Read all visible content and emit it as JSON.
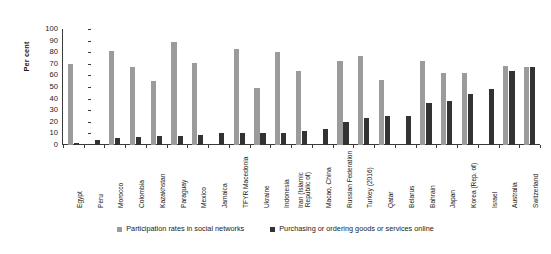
{
  "chart_data": {
    "type": "bar",
    "title": "",
    "xlabel": "",
    "ylabel": "Per cent",
    "ylim": [
      0,
      100
    ],
    "yticks": [
      0,
      10,
      20,
      30,
      40,
      50,
      60,
      70,
      80,
      90,
      100
    ],
    "grid": false,
    "legend_position": "bottom",
    "categories": [
      "Egypt",
      "Peru",
      "Morocco",
      "Colombia",
      "Kazakhstan",
      "Paraguay",
      "Mexico",
      "Jamaica",
      "TFYR Macedonia",
      "Ukraine",
      "Indonesia",
      "Iran (Islamic Republic of)",
      "Macao, China",
      "Russian Federation",
      "Turkey (2016)",
      "Qatar",
      "Belarus",
      "Bahrain",
      "Japan",
      "Korea (Rep. of)",
      "Israel",
      "Australia",
      "Switzerland"
    ],
    "series": [
      {
        "name": "Participation rates in social networks",
        "color": "#9b9b9b",
        "values": [
          70,
          0,
          81,
          67,
          55,
          89,
          71,
          0,
          83,
          49,
          80,
          64,
          0,
          72,
          77,
          56,
          0,
          72,
          62,
          62,
          0,
          68,
          67
        ]
      },
      {
        "name": "Purchasing or ordering goods or services online",
        "color": "#333333",
        "values": [
          2,
          4,
          6,
          7,
          8,
          8,
          9,
          10,
          10,
          10,
          10,
          12,
          14,
          20,
          23,
          25,
          25,
          36,
          38,
          44,
          48,
          64,
          67
        ]
      }
    ]
  },
  "legend": {
    "items": [
      {
        "label": "Participation rates in social networks",
        "swatch": "social"
      },
      {
        "label": "Purchasing or ordering goods or services online",
        "swatch": "purchase"
      }
    ]
  },
  "axis": {
    "y_title": "Per cent",
    "y_tick_labels": [
      "100",
      "90",
      "80",
      "70",
      "60",
      "50",
      "40",
      "30",
      "20",
      "10",
      "0"
    ]
  }
}
